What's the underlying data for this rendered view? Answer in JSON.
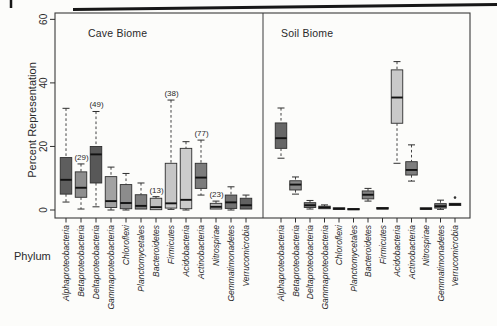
{
  "figure": {
    "panel_titles": {
      "left": "Cave Biome",
      "right": "Soil Biome"
    },
    "y_axis_title": "Percent Representation",
    "x_axis_title": "Phylum"
  },
  "chart_data": {
    "type": "boxplot",
    "title": "",
    "xlabel": "Phylum",
    "ylabel": "Percent Representation",
    "ylim": [
      0,
      60
    ],
    "y_ticks": [
      0,
      20,
      40,
      60
    ],
    "grid": false,
    "legend": "none",
    "whisker_style": "dashed-stem-solid-cap",
    "categories": [
      "Alphaproteobacteria",
      "Betaproteobacteria",
      "Deltaproteobacteria",
      "Gammaproteobacteria",
      "Chloroflexi",
      "Planctomycetales",
      "Bacteroidetes",
      "Firmicutes",
      "Acidobacteria",
      "Actinobacteria",
      "Nitrospirae",
      "Gemmatimonadetes",
      "Verrucomicrobia"
    ],
    "panels": [
      {
        "title": "Cave Biome",
        "boxes": [
          {
            "phylum": "Alphaproteobacteria",
            "whisker_low": 2.5,
            "q1": 5,
            "median": 9.5,
            "q3": 16.5,
            "whisker_high": 32,
            "count_label": "",
            "outliers": [],
            "fill": "#5e5e5e"
          },
          {
            "phylum": "Betaproteobacteria",
            "whisker_low": 0.3,
            "q1": 4,
            "median": 7,
            "q3": 12,
            "whisker_high": 14.5,
            "count_label": "(29)",
            "outliers": [],
            "fill": "#8e8e8e"
          },
          {
            "phylum": "Deltaproteobacteria",
            "whisker_low": 1,
            "q1": 8.5,
            "median": 17.5,
            "q3": 20,
            "whisker_high": 31,
            "count_label": "(49)",
            "outliers": [],
            "fill": "#585858"
          },
          {
            "phylum": "Gammaproteobacteria",
            "whisker_low": 0,
            "q1": 0.8,
            "median": 2.8,
            "q3": 10.5,
            "whisker_high": 13.5,
            "count_label": "",
            "outliers": [],
            "fill": "#a2a2a2"
          },
          {
            "phylum": "Chloroflexi",
            "whisker_low": 0,
            "q1": 0.4,
            "median": 2.2,
            "q3": 8,
            "whisker_high": 11.5,
            "count_label": "",
            "outliers": [],
            "fill": "#8c8c8c"
          },
          {
            "phylum": "Planctomycetales",
            "whisker_low": 0,
            "q1": 0.3,
            "median": 1.3,
            "q3": 4.8,
            "whisker_high": 8.5,
            "count_label": "",
            "outliers": [],
            "fill": "#7e7e7e"
          },
          {
            "phylum": "Bacteroidetes",
            "whisker_low": 0,
            "q1": 0.1,
            "median": 0.9,
            "q3": 3.7,
            "whisker_high": 4.2,
            "count_label": "(13)",
            "outliers": [],
            "fill": "#c0c0c0"
          },
          {
            "phylum": "Firmicutes",
            "whisker_low": 0.2,
            "q1": 0.6,
            "median": 2.1,
            "q3": 14.7,
            "whisker_high": 34.6,
            "count_label": "(38)",
            "outliers": [],
            "fill": "#c6c6c6"
          },
          {
            "phylum": "Acidobacteria",
            "whisker_low": 0,
            "q1": 0.4,
            "median": 3.2,
            "q3": 19.4,
            "whisker_high": 21.5,
            "count_label": "",
            "outliers": [],
            "fill": "#cccccc"
          },
          {
            "phylum": "Actinobacteria",
            "whisker_low": 4.7,
            "q1": 6.8,
            "median": 10.2,
            "q3": 14.7,
            "whisker_high": 22,
            "count_label": "(77)",
            "outliers": [],
            "fill": "#7c7c7c"
          },
          {
            "phylum": "Nitrospirae",
            "whisker_low": 0,
            "q1": 0.3,
            "median": 1,
            "q3": 2.1,
            "whisker_high": 2.8,
            "count_label": "(23)",
            "outliers": [],
            "fill": "#b4b4b4"
          },
          {
            "phylum": "Gemmatimonadetes",
            "whisker_low": 0,
            "q1": 0.5,
            "median": 2.4,
            "q3": 4.7,
            "whisker_high": 7.3,
            "count_label": "",
            "outliers": [],
            "fill": "#737373"
          },
          {
            "phylum": "Verrucomicrobia",
            "whisker_low": 0,
            "q1": 0.3,
            "median": 1.5,
            "q3": 3.7,
            "whisker_high": 4.7,
            "count_label": "",
            "outliers": [],
            "fill": "#616161"
          }
        ]
      },
      {
        "title": "Soil Biome",
        "boxes": [
          {
            "phylum": "Alphaproteobacteria",
            "whisker_low": 16.3,
            "q1": 19.4,
            "median": 22.6,
            "q3": 27.4,
            "whisker_high": 32.1,
            "count_label": "",
            "outliers": [],
            "fill": "#666666"
          },
          {
            "phylum": "Betaproteobacteria",
            "whisker_low": 5,
            "q1": 6.3,
            "median": 8,
            "q3": 9.2,
            "whisker_high": 10.4,
            "count_label": "",
            "outliers": [],
            "fill": "#8a8a8a"
          },
          {
            "phylum": "Deltaproteobacteria",
            "whisker_low": 0.3,
            "q1": 0.8,
            "median": 1.5,
            "q3": 2.3,
            "whisker_high": 3,
            "count_label": "",
            "outliers": [],
            "fill": "#7e7e7e"
          },
          {
            "phylum": "Gammaproteobacteria",
            "whisker_low": 0.1,
            "q1": 0.4,
            "median": 0.8,
            "q3": 1.2,
            "whisker_high": 1.6,
            "count_label": "",
            "outliers": [],
            "fill": "#909090"
          },
          {
            "phylum": "Chloroflexi",
            "whisker_low": 0,
            "q1": 0.2,
            "median": 0.4,
            "q3": 0.7,
            "whisker_high": 1,
            "count_label": "",
            "outliers": [],
            "fill": "#8a8a8a"
          },
          {
            "phylum": "Planctomycetales",
            "whisker_low": 0,
            "q1": 0.1,
            "median": 0.25,
            "q3": 0.45,
            "whisker_high": 0.6,
            "count_label": "",
            "outliers": [],
            "fill": "#888888"
          },
          {
            "phylum": "Bacteroidetes",
            "whisker_low": 2.8,
            "q1": 3.5,
            "median": 4.8,
            "q3": 6,
            "whisker_high": 6.8,
            "count_label": "",
            "outliers": [],
            "fill": "#828282"
          },
          {
            "phylum": "Firmicutes",
            "whisker_low": 0.2,
            "q1": 0.3,
            "median": 0.5,
            "q3": 0.8,
            "whisker_high": 1,
            "count_label": "",
            "outliers": [],
            "fill": "#6e6e6e"
          },
          {
            "phylum": "Acidobacteria",
            "whisker_low": 14.7,
            "q1": 27.3,
            "median": 35.4,
            "q3": 44.1,
            "whisker_high": 46.7,
            "count_label": "",
            "outliers": [],
            "fill": "#c9c9c9"
          },
          {
            "phylum": "Actinobacteria",
            "whisker_low": 9.1,
            "q1": 11,
            "median": 12.6,
            "q3": 15.2,
            "whisker_high": 20.5,
            "count_label": "",
            "outliers": [],
            "fill": "#7e7e7e"
          },
          {
            "phylum": "Nitrospirae",
            "whisker_low": 0,
            "q1": 0.2,
            "median": 0.4,
            "q3": 0.7,
            "whisker_high": 1,
            "count_label": "",
            "outliers": [],
            "fill": "#929292"
          },
          {
            "phylum": "Gemmatimonadetes",
            "whisker_low": 0.2,
            "q1": 0.6,
            "median": 1.2,
            "q3": 2,
            "whisker_high": 3.1,
            "count_label": "",
            "outliers": [],
            "fill": "#787878"
          },
          {
            "phylum": "Verrucomicrobia",
            "whisker_low": 1.2,
            "q1": 1.4,
            "median": 1.8,
            "q3": 2.1,
            "whisker_high": 2.4,
            "count_label": "",
            "outliers": [
              3.9
            ],
            "fill": "#5e5e5e"
          }
        ]
      }
    ]
  }
}
